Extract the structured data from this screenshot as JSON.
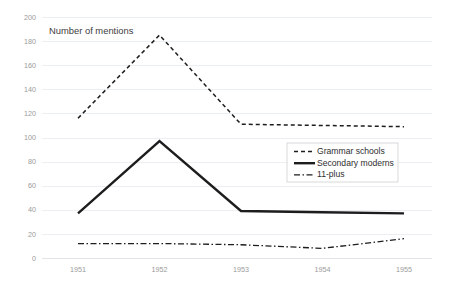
{
  "chart_data": {
    "type": "line",
    "title": "",
    "axis_title": "Number of mentions",
    "xlabel": "",
    "ylabel": "Number of mentions",
    "categories": [
      "1951",
      "1952",
      "1953",
      "1954",
      "1955"
    ],
    "x": [
      1951,
      1952,
      1953,
      1954,
      1955
    ],
    "ylim": [
      0,
      200
    ],
    "yticks": [
      0,
      20,
      40,
      60,
      80,
      100,
      120,
      140,
      160,
      180,
      200
    ],
    "ytick_labels": [
      "0",
      "20",
      "40",
      "60",
      "80",
      "100",
      "120",
      "140",
      "160",
      "180",
      "200"
    ],
    "grid": "horizontal",
    "legend_position": "center-right",
    "series": [
      {
        "name": "Grammar schools",
        "style": "dashed",
        "color": "#1d1d1d",
        "values": [
          116,
          185,
          111,
          110,
          109
        ]
      },
      {
        "name": "Secondary moderns",
        "style": "solid",
        "color": "#1d1d1d",
        "values": [
          37,
          97,
          39,
          38,
          37
        ]
      },
      {
        "name": "11-plus",
        "style": "dash-dot",
        "color": "#1d1d1d",
        "values": [
          12,
          12,
          11,
          8,
          16
        ]
      }
    ]
  },
  "legend": {
    "items": [
      {
        "label": "Grammar schools"
      },
      {
        "label": "Secondary moderns"
      },
      {
        "label": "11-plus"
      }
    ]
  },
  "colors": {
    "background": "#ffffff",
    "grid": "#eceff1",
    "tick_text": "#9a9a9a",
    "series_ink": "#1d1d1d",
    "legend_border": "#d5d5d5"
  }
}
